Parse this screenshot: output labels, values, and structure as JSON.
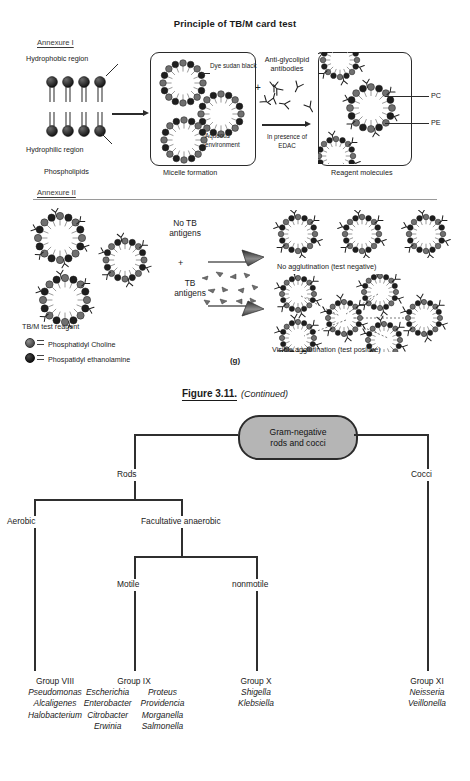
{
  "figure": {
    "title": "Principle of TB/M card test",
    "annexure1": "Annexure I",
    "annexure2": "Annexure II",
    "panel_letter": "(g)",
    "annexure1_labels": {
      "hydrophobic": "Hydrophobic region",
      "hydrophilic": "Hydrophilic region",
      "phospholipids": "Phospholipids",
      "dye": "Dye sudan black",
      "aqueous": "Aqueous environment",
      "micelle": "Micelle formation",
      "antibodies": "Anti-glycolipid antibodies",
      "edac": "In presence of EDAC",
      "plus": "+",
      "pc": "PC",
      "pe": "PE",
      "reagent": "Reagent molecules"
    },
    "annexure2_labels": {
      "no_tb_antigens": "No TB antigens",
      "tb_antigens": "TB antigens",
      "plus": "+",
      "test_reagent": "TB/M test reagent",
      "no_agglutination": "No agglutination (test negative)",
      "visible_agglutination": "Visible agglutination (test positive)"
    },
    "legend": [
      {
        "name": "Phosphatidyl Choline",
        "swatch": "pc"
      },
      {
        "name": "Phospatidyl ethanolamine",
        "swatch": "pe"
      }
    ]
  },
  "caption": {
    "number": "Figure 3.11.",
    "continued": "(Continued)"
  },
  "tree": {
    "root": "Gram-negative rods and cocci",
    "root_line1": "Gram-negative",
    "root_line2": "rods and cocci",
    "level1": [
      {
        "label": "Rods"
      },
      {
        "label": "Cocci"
      }
    ],
    "level2": [
      {
        "label": "Aerobic"
      },
      {
        "label": "Facultative anaerobic"
      }
    ],
    "level3": [
      {
        "label": "Motile"
      },
      {
        "label": "nonmotile"
      }
    ],
    "groups": [
      {
        "heading": "Group VIII",
        "columns": [
          [
            "Pseudomonas",
            "Alcaligenes",
            "Halobacterium"
          ]
        ]
      },
      {
        "heading": "Group IX",
        "columns": [
          [
            "Escherichia",
            "Enterobacter",
            "Citrobacter",
            "Erwinia"
          ],
          [
            "Proteus",
            "Providencia",
            "Morganella",
            "Salmonella"
          ]
        ]
      },
      {
        "heading": "Group X",
        "columns": [
          [
            "Shigella",
            "Klebsiella"
          ]
        ]
      },
      {
        "heading": "Group XI",
        "columns": [
          [
            "Neisseria",
            "Veillonella"
          ]
        ]
      }
    ]
  },
  "colors": {
    "root_fill": "#b5b5b5",
    "line": "#2f2f2f",
    "pc": "#6f6f6f",
    "pe": "#1e1e1e"
  }
}
